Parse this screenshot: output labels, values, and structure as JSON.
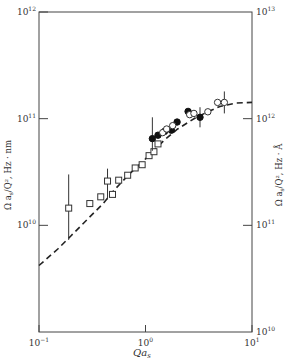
{
  "chart_data": {
    "type": "scatter",
    "title": "",
    "xlabel": "Qa_s",
    "ylabel_left": "Ω a_s / Q², Hz · nm",
    "ylabel_right": "Ω a_s / Q², Hz · Å",
    "xscale": "log",
    "yscale": "log",
    "xlim": [
      0.1,
      10
    ],
    "ylim_left": [
      1000000000.0,
      1000000000000.0
    ],
    "ylim_right": [
      10000000000.0,
      10000000000000.0
    ],
    "x_ticks": [
      {
        "value": 0.1,
        "label": "10^-1"
      },
      {
        "value": 1,
        "label": "10^0"
      },
      {
        "value": 10,
        "label": "10^1"
      }
    ],
    "y_ticks_left": [
      {
        "value": 10000000000.0,
        "label": "10^10"
      },
      {
        "value": 100000000000.0,
        "label": "10^11"
      },
      {
        "value": 1000000000000.0,
        "label": "10^12"
      }
    ],
    "y_ticks_right": [
      {
        "value": 10000000000.0,
        "label": "10^10"
      },
      {
        "value": 100000000000.0,
        "label": "10^11"
      },
      {
        "value": 1000000000000.0,
        "label": "10^12"
      },
      {
        "value": 10000000000000.0,
        "label": "10^13"
      }
    ],
    "grid": false,
    "legend": null,
    "series": [
      {
        "name": "open squares",
        "marker": "square-open",
        "points": [
          {
            "x": 0.19,
            "y": 14500000000.0,
            "err_lo": 7300000000.0,
            "err_hi": 30000000000.0
          },
          {
            "x": 0.3,
            "y": 16000000000.0
          },
          {
            "x": 0.38,
            "y": 18500000000.0
          },
          {
            "x": 0.44,
            "y": 26000000000.0,
            "err_lo": 17500000000.0,
            "err_hi": 34000000000.0
          },
          {
            "x": 0.49,
            "y": 19500000000.0
          },
          {
            "x": 0.56,
            "y": 26500000000.0
          },
          {
            "x": 0.68,
            "y": 29500000000.0
          },
          {
            "x": 0.8,
            "y": 34500000000.0
          },
          {
            "x": 0.93,
            "y": 37000000000.0
          },
          {
            "x": 1.08,
            "y": 45000000000.0
          },
          {
            "x": 1.2,
            "y": 49000000000.0
          },
          {
            "x": 1.31,
            "y": 58000000000.0
          }
        ]
      },
      {
        "name": "filled circles",
        "marker": "circle-filled",
        "points": [
          {
            "x": 1.16,
            "y": 65000000000.0,
            "err_lo": 50000000000.0,
            "err_hi": 103000000000.0
          },
          {
            "x": 1.31,
            "y": 70000000000.0
          },
          {
            "x": 1.51,
            "y": 76000000000.0
          },
          {
            "x": 1.75,
            "y": 78000000000.0
          },
          {
            "x": 1.98,
            "y": 93000000000.0
          },
          {
            "x": 2.51,
            "y": 117000000000.0
          },
          {
            "x": 3.25,
            "y": 103000000000.0,
            "err_lo": 83000000000.0,
            "err_hi": 128000000000.0
          }
        ]
      },
      {
        "name": "open circles",
        "marker": "circle-open",
        "points": [
          {
            "x": 1.45,
            "y": 74000000000.0
          },
          {
            "x": 1.58,
            "y": 80000000000.0
          },
          {
            "x": 1.8,
            "y": 86000000000.0
          },
          {
            "x": 2.6,
            "y": 109000000000.0
          },
          {
            "x": 2.85,
            "y": 112000000000.0
          },
          {
            "x": 3.85,
            "y": 116000000000.0
          },
          {
            "x": 4.75,
            "y": 142000000000.0
          },
          {
            "x": 5.5,
            "y": 142000000000.0,
            "err_lo": 112000000000.0,
            "err_hi": 180000000000.0
          }
        ]
      }
    ],
    "curves": [
      {
        "name": "theory",
        "style": "dashed",
        "points": [
          {
            "x": 0.1,
            "y": 4200000000.0
          },
          {
            "x": 0.15,
            "y": 6000000000.0
          },
          {
            "x": 0.2,
            "y": 8000000000.0
          },
          {
            "x": 0.3,
            "y": 12000000000.0
          },
          {
            "x": 0.4,
            "y": 16000000000.0
          },
          {
            "x": 0.5,
            "y": 21000000000.0
          },
          {
            "x": 0.7,
            "y": 30000000000.0
          },
          {
            "x": 1.0,
            "y": 42000000000.0
          },
          {
            "x": 1.5,
            "y": 63000000000.0
          },
          {
            "x": 2.0,
            "y": 80000000000.0
          },
          {
            "x": 3.0,
            "y": 103000000000.0
          },
          {
            "x": 4.0,
            "y": 118000000000.0
          },
          {
            "x": 5.0,
            "y": 130000000000.0
          },
          {
            "x": 7.0,
            "y": 140000000000.0
          },
          {
            "x": 10.0,
            "y": 142000000000.0
          }
        ]
      }
    ]
  },
  "labels": {
    "xlabel": "Qa",
    "xlabel_sub": "s",
    "ylabel_left": "Ω a",
    "ylabel_left_rest": "/Q², Hz · nm",
    "ylabel_right": "Ω a",
    "ylabel_right_rest": "/Q², Hz · Å",
    "sub": "s"
  }
}
